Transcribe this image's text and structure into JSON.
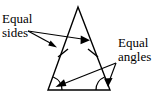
{
  "figure": {
    "background_color": "#ffffff",
    "stroke_color": "#000000"
  },
  "labels": {
    "equal_sides": {
      "line1": "Equal",
      "line2": "sides"
    },
    "equal_angles": {
      "line1": "Equal",
      "line2": "angles"
    }
  },
  "geometry": {
    "triangle": {
      "apex": [
        78,
        7
      ],
      "base_left": [
        48,
        90
      ],
      "base_right": [
        110,
        90
      ]
    },
    "tick_marks": [
      {
        "name": "left-side-tick",
        "at": [
          63,
          54
        ]
      },
      {
        "name": "right-side-tick",
        "at": [
          93,
          54
        ]
      }
    ],
    "angle_arcs": [
      {
        "name": "left-base-angle-arc",
        "vertex": [
          48,
          90
        ]
      },
      {
        "name": "right-base-angle-arc",
        "vertex": [
          110,
          90
        ]
      }
    ],
    "pointers": [
      {
        "name": "sides-pointer-left",
        "from": [
          28,
          31
        ],
        "to": [
          56,
          47
        ]
      },
      {
        "name": "sides-pointer-right",
        "from": [
          28,
          31
        ],
        "to": [
          89,
          40
        ]
      },
      {
        "name": "angles-pointer-left",
        "from": [
          116,
          63
        ],
        "to": [
          57,
          87
        ]
      },
      {
        "name": "angles-pointer-right",
        "from": [
          116,
          63
        ],
        "to": [
          108,
          86
        ]
      }
    ]
  }
}
